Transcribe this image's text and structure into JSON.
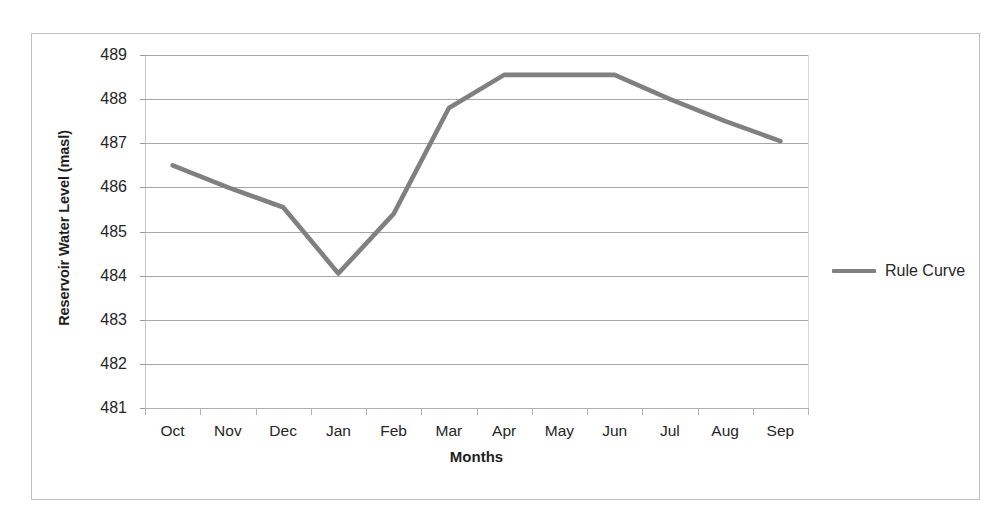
{
  "chart_data": {
    "type": "line",
    "title": "",
    "xlabel": "Months",
    "ylabel": "Reservoir Water Level (masl)",
    "categories": [
      "Oct",
      "Nov",
      "Dec",
      "Jan",
      "Feb",
      "Mar",
      "Apr",
      "May",
      "Jun",
      "Jul",
      "Aug",
      "Sep"
    ],
    "series": [
      {
        "name": "Rule Curve",
        "color": "#808080",
        "values": [
          486.5,
          486.0,
          485.55,
          484.05,
          485.4,
          487.8,
          488.55,
          488.55,
          488.55,
          488.0,
          487.5,
          487.05
        ]
      }
    ],
    "ylim": [
      481,
      489
    ],
    "y_ticks": [
      489,
      488,
      487,
      486,
      485,
      484,
      483,
      482,
      481
    ],
    "y_tick_labels": [
      "489",
      "488",
      "487",
      "486",
      "485",
      "484",
      "483",
      "482",
      "481"
    ],
    "grid": true,
    "grid_axis": "y",
    "legend_position": "right",
    "legend_entries": [
      "Rule Curve"
    ],
    "background_color": "#ffffff",
    "gridline_color": "#a6a6a6",
    "border_color": "#bfbfbf"
  },
  "axes": {
    "y_title": "Reservoir Water Level (masl)",
    "x_title": "Months"
  },
  "legend": {
    "items": [
      {
        "label": "Rule Curve",
        "color": "#808080"
      }
    ]
  }
}
